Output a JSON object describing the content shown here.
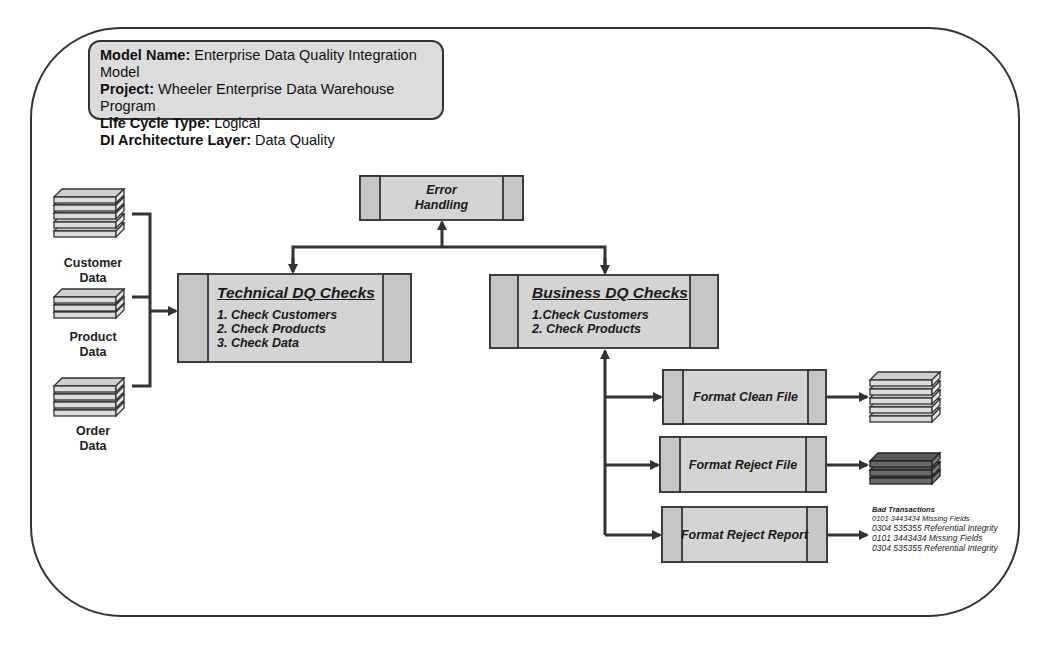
{
  "header": {
    "rows": [
      {
        "key": "Model Name:",
        "value": " Enterprise Data Quality Integration Model"
      },
      {
        "key": "Project:",
        "value": " Wheeler Enterprise Data Warehouse Program"
      },
      {
        "key": "Life Cycle Type:",
        "value": " Logical"
      },
      {
        "key": "DI Architecture Layer:",
        "value": " Data Quality"
      }
    ]
  },
  "sources": [
    {
      "label_line1": "Customer",
      "label_line2": "Data",
      "icon": "database-stack-icon"
    },
    {
      "label_line1": "Product",
      "label_line2": "Data",
      "icon": "database-stack-icon"
    },
    {
      "label_line1": "Order",
      "label_line2": "Data",
      "icon": "database-stack-icon"
    }
  ],
  "processes": {
    "error_handling": {
      "line1": "Error",
      "line2": "Handling"
    },
    "technical_dq": {
      "title": "Technical  DQ Checks",
      "items": [
        "1. Check Customers",
        "2. Check Products",
        "3. Check Data"
      ]
    },
    "business_dq": {
      "title": "Business DQ Checks",
      "items": [
        "1.Check Customers",
        "2. Check Products"
      ]
    },
    "format_clean": {
      "label": "Format Clean File"
    },
    "format_reject_file": {
      "label": "Format Reject File"
    },
    "format_reject_report": {
      "label": "Format Reject Report"
    }
  },
  "outputs": {
    "clean_file": {
      "icon": "database-stack-icon",
      "shade": "light"
    },
    "reject_file": {
      "icon": "database-stack-icon",
      "shade": "dark"
    },
    "reject_report": {
      "title": "Bad Transactions",
      "rows": [
        "0101 3443434 Missing Fields",
        "0304 535355 Referential Integrity",
        "0101 3443434 Missing Fields",
        "0304 535355 Referential Integrity"
      ]
    }
  },
  "colors": {
    "box_fill": "#d4d4d4",
    "box_side_fill": "#c6c6c6",
    "header_fill": "#dcdcdc",
    "stroke": "#333333",
    "dark_stack": "#5a5a5a",
    "light_stack": "#d8d8d8"
  }
}
